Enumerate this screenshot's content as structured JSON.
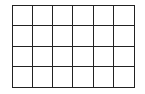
{
  "grid": {
    "rows": 4,
    "columns": 6,
    "line_color": "#222222",
    "fill_color": "#ffffff",
    "cells_filled": []
  }
}
